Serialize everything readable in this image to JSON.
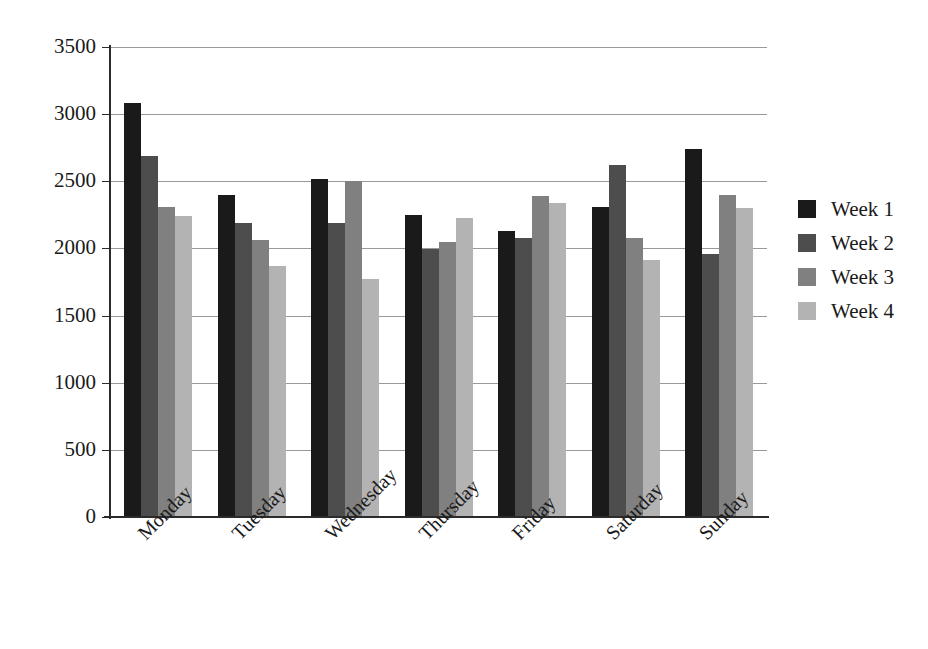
{
  "chart_data": {
    "type": "bar",
    "title": "",
    "subtitle": "",
    "xlabel": "",
    "ylabel": "",
    "grid": true,
    "legend_position": "right",
    "ylim": [
      0,
      3500
    ],
    "ytick_step": 500,
    "ytick_labels": [
      "3500",
      "3000",
      "2500",
      "2000",
      "1500",
      "1000",
      "500",
      "0"
    ],
    "ytick_values": [
      3500,
      3000,
      2500,
      2000,
      1500,
      1000,
      500,
      0
    ],
    "categories": [
      "Monday",
      "Tuesday",
      "Wednesday",
      "Thursday",
      "Friday",
      "Saturday",
      "Sunday"
    ],
    "series": [
      {
        "name": "Week 1",
        "color": "#1a1a1a",
        "values": [
          3080,
          2400,
          2520,
          2250,
          2130,
          2310,
          2740
        ]
      },
      {
        "name": "Week 2",
        "color": "#4d4d4d",
        "values": [
          2690,
          2190,
          2190,
          1995,
          2075,
          2620,
          1960
        ]
      },
      {
        "name": "Week 3",
        "color": "#808080",
        "values": [
          2310,
          2065,
          2500,
          2050,
          2390,
          2080,
          2400
        ]
      },
      {
        "name": "Week 4",
        "color": "#b3b3b3",
        "values": [
          2245,
          1870,
          1770,
          2230,
          2335,
          1915,
          2300
        ]
      }
    ]
  },
  "legend": {
    "entries": [
      {
        "label": "Week 1",
        "color": "#1a1a1a"
      },
      {
        "label": "Week 2",
        "color": "#4d4d4d"
      },
      {
        "label": "Week 3",
        "color": "#808080"
      },
      {
        "label": "Week 4",
        "color": "#b3b3b3"
      }
    ]
  },
  "axes": {
    "grid_color": "#9a9a9a",
    "axis_color": "#2b2b2b"
  }
}
